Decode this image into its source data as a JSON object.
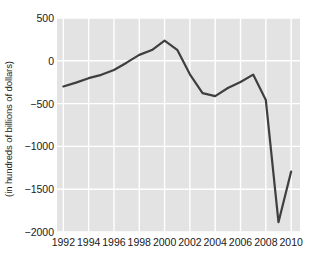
{
  "chart_data": {
    "type": "line",
    "title": "",
    "xlabel": "",
    "ylabel": "(in hundreds of billions of dollars)",
    "xlim": [
      1991.5,
      2010.7
    ],
    "ylim": [
      -2000,
      500
    ],
    "grid": true,
    "legend": null,
    "xticks": [
      "1992",
      "1994",
      "1996",
      "1998",
      "2000",
      "2002",
      "2004",
      "2006",
      "2008",
      "2010"
    ],
    "xtick_values": [
      1992,
      1994,
      1996,
      1998,
      2000,
      2002,
      2004,
      2006,
      2008,
      2010
    ],
    "yticks": [
      "500",
      "0",
      "−500",
      "−1000",
      "−1500",
      "−2000"
    ],
    "ytick_values": [
      500,
      0,
      -500,
      -1000,
      -1500,
      -2000
    ],
    "x": [
      1992,
      1993,
      1994,
      1995,
      1996,
      1997,
      1998,
      1999,
      2000,
      2001,
      2002,
      2003,
      2004,
      2005,
      2006,
      2007,
      2008,
      2009,
      2010
    ],
    "values": [
      -300,
      -255,
      -203,
      -164,
      -107,
      -22,
      69,
      126,
      236,
      128,
      -158,
      -377,
      -413,
      -318,
      -248,
      -161,
      -459,
      -1885,
      -1294
    ],
    "series": [
      {
        "name": "",
        "color": "#3f3f3f",
        "linewidth": 2.2,
        "values": [
          -300,
          -255,
          -203,
          -164,
          -107,
          -22,
          69,
          126,
          236,
          128,
          -158,
          -377,
          -413,
          -318,
          -248,
          -161,
          -459,
          -1885,
          -1294
        ]
      }
    ],
    "colors": {
      "line": "#3f3f3f",
      "plot_background": "#e3e3e3",
      "gridline": "#ffffff",
      "figure_background": "#ffffff",
      "text": "#1a1a1a"
    }
  }
}
